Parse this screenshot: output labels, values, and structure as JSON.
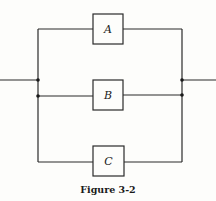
{
  "figure": {
    "caption": "Figure 3-2",
    "components": [
      {
        "label": "A"
      },
      {
        "label": "B"
      },
      {
        "label": "C"
      }
    ]
  }
}
